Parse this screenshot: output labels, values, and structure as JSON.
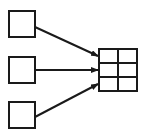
{
  "diagram": {
    "colors": {
      "stroke": "#1a1a1a",
      "background": "#ffffff"
    },
    "sources": [
      {
        "id": "source-top",
        "x": 9,
        "y": 11,
        "w": 26,
        "h": 26
      },
      {
        "id": "source-middle",
        "x": 9,
        "y": 57,
        "w": 26,
        "h": 26
      },
      {
        "id": "source-bottom",
        "x": 9,
        "y": 102,
        "w": 26,
        "h": 26
      }
    ],
    "grid": {
      "x": 99,
      "y": 49,
      "w": 38,
      "h": 42,
      "rows": 3,
      "cols": 2
    },
    "arrows": [
      {
        "from": "source-top",
        "x1": 35,
        "y1": 27,
        "x2": 98,
        "y2": 56
      },
      {
        "from": "source-middle",
        "x1": 35,
        "y1": 70,
        "x2": 98,
        "y2": 70
      },
      {
        "from": "source-bottom",
        "x1": 35,
        "y1": 117,
        "x2": 98,
        "y2": 84
      }
    ]
  }
}
